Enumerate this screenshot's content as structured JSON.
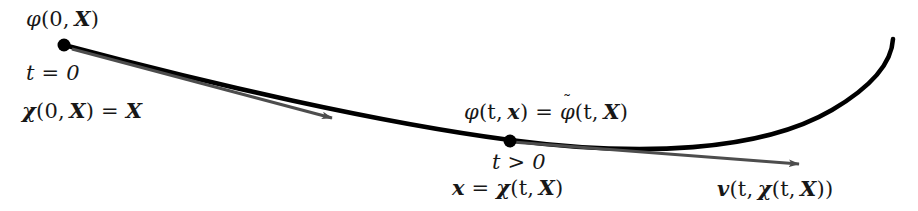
{
  "figure": {
    "kind": "continuum-mechanics-motion-diagram",
    "width": 918,
    "height": 211,
    "background_color": "#ffffff",
    "curve_color": "#000000",
    "arrow_color": "#4d4d4d",
    "point_color": "#000000"
  },
  "labels": {
    "initial_spatial_field": {
      "phi": "φ",
      "args": "(0, ",
      "bold_arg": "X",
      "close": ")"
    },
    "initial_time": "t = 0",
    "initial_motion": {
      "chi": "χ",
      "open": "(0, ",
      "bold_arg": "X",
      "mid": ") = ",
      "bold_result": "X"
    },
    "current_field_equality": {
      "phi": "φ",
      "open": "(t, ",
      "bold_x": "x",
      "mid": ") = ",
      "phi_tilde": "φ",
      "tilde": "˜",
      "open2": "(t, ",
      "bold_X": "X",
      "close": ")"
    },
    "current_time": "t > 0",
    "current_position": {
      "bold_x": "x",
      "eq": " = ",
      "chi": "χ",
      "open": "(t, ",
      "bold_X": "X",
      "close": ")"
    },
    "velocity": {
      "bold_v": "v",
      "open": "(t, ",
      "chi": "χ",
      "open2": "(t, ",
      "bold_X": "X",
      "close": "))"
    }
  },
  "points": [
    {
      "name": "initial-particle-point",
      "x": 64,
      "y": 45,
      "r": 6.5
    },
    {
      "name": "current-particle-point",
      "x": 510,
      "y": 141,
      "r": 6.5
    }
  ],
  "geometry": {
    "trajectory_path": "M 64 45 C 210 84, 380 123, 510 140 C 640 157, 760 152, 832 110 C 878 83, 892 58, 893 39",
    "tangent_arrow_initial": {
      "x1": 72,
      "y1": 49,
      "x2": 332,
      "y2": 118
    },
    "tangent_arrow_current": {
      "x1": 512,
      "y1": 142,
      "x2": 799,
      "y2": 164
    }
  }
}
